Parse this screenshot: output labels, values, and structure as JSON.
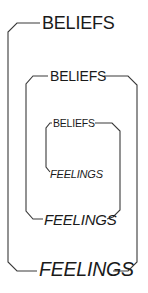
{
  "diagram": {
    "type": "nested-spiral",
    "line_color": "#3a3a3a",
    "text_color": "#1a1a1a",
    "levels": [
      {
        "level": "outer",
        "top_label": "BELIEFS",
        "bottom_label": "FEELINGS"
      },
      {
        "level": "middle",
        "top_label": "BELIEFS",
        "bottom_label": "FEELINGS"
      },
      {
        "level": "inner",
        "top_label": "BELIEFS",
        "bottom_label": "FEELINGS"
      }
    ]
  }
}
